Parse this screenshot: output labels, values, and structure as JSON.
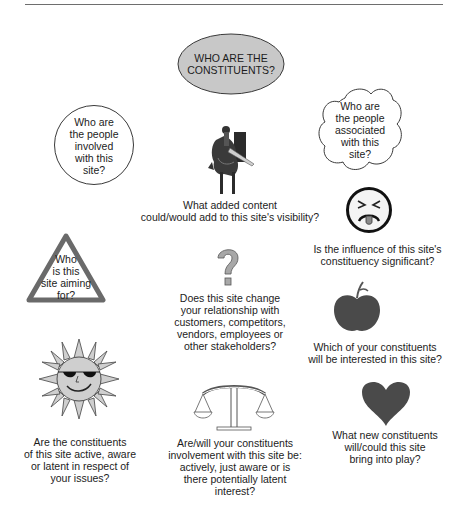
{
  "diagram": {
    "title": "WHO ARE THE CONSTITUENTS?",
    "title_lines": [
      "WHO ARE THE",
      "CONSTITUENTS?"
    ],
    "colors": {
      "title_fill": "#c8c8c8",
      "shape_stroke": "#3a3a3a",
      "icon_dark": "#4a4a4a",
      "icon_light": "#d0d0d0",
      "rule": "#6e6e6e"
    },
    "nodes": [
      {
        "id": "circle",
        "shape": "circle",
        "icon": "circle-bubble",
        "lines": [
          "Who are",
          "the people",
          "involved",
          "with this",
          "site?"
        ]
      },
      {
        "id": "cloud",
        "shape": "cloud",
        "icon": "cloud-bubble",
        "lines": [
          "Who are",
          "the people",
          "associated",
          "with this",
          "site?"
        ]
      },
      {
        "id": "knight",
        "icon": "knight-on-horse-icon",
        "lines": [
          "What added content",
          "could/would add to this site's visibility?"
        ]
      },
      {
        "id": "face",
        "icon": "disgusted-face-icon",
        "lines": [
          "Is the influence of this site's",
          "constituency significant?"
        ]
      },
      {
        "id": "triangle",
        "shape": "triangle",
        "icon": "warning-triangle",
        "lines": [
          "Who",
          "is this",
          "site aiming",
          "for?"
        ]
      },
      {
        "id": "question",
        "icon": "question-mark-icon",
        "glyph": "?",
        "lines": [
          "Does this site change",
          "your relationship with",
          "customers, competitors,",
          "vendors, employees or",
          "other stakeholders?"
        ]
      },
      {
        "id": "apple",
        "icon": "apple-icon",
        "lines": [
          "Which of your constituents",
          "will be interested in this site?"
        ]
      },
      {
        "id": "sun",
        "icon": "sun-with-sunglasses-icon",
        "lines": [
          "Are the constituents",
          "of this site active, aware",
          "or latent in respect of",
          "your issues?"
        ]
      },
      {
        "id": "scales",
        "icon": "balance-scales-icon",
        "lines": [
          "Are/will your constituents",
          "involvement with this site be:",
          "actively, just aware or is",
          "there potentially latent",
          "interest?"
        ]
      },
      {
        "id": "heart",
        "icon": "heart-icon",
        "lines": [
          "What new constituents",
          "will/could this site",
          "bring into play?"
        ]
      }
    ]
  }
}
